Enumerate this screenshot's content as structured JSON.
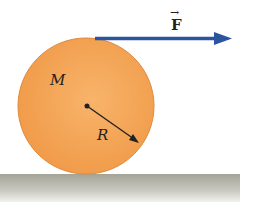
{
  "diagram": {
    "labels": {
      "mass": "M",
      "radius": "R",
      "force": "F",
      "force_arrow": "→"
    },
    "colors": {
      "cylinder": "#f4a85a",
      "cylinder_edge": "#e0893a",
      "force_arrow": "#2b55a0",
      "ground_top": "#a8a89a",
      "ground_bottom": "#e8e8e2",
      "text": "#222222"
    }
  }
}
